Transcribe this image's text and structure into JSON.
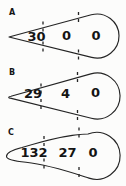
{
  "figure": {
    "panels": [
      {
        "label": "A",
        "counts": [
          "30",
          "0",
          "0"
        ]
      },
      {
        "label": "B",
        "counts": [
          "29",
          "4",
          "0"
        ]
      },
      {
        "label": "C",
        "counts": [
          "132",
          "27",
          "0"
        ]
      }
    ],
    "colors": {
      "ink": "#242424",
      "background": "#fcfcfb"
    }
  }
}
